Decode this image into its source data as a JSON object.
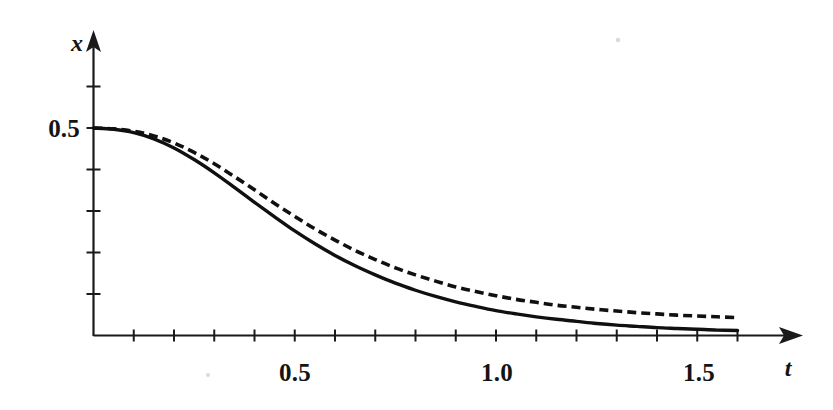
{
  "figure": {
    "background_color": "#ffffff",
    "ink_color": "#101010",
    "width": 833,
    "height": 410
  },
  "axes": {
    "x_axis": {
      "name": "t",
      "labels": [
        "0.5",
        "1.0",
        "1.5"
      ],
      "label_values": [
        0.5,
        1.0,
        1.5
      ],
      "tick_values": [
        0.1,
        0.2,
        0.3,
        0.4,
        0.5,
        0.6,
        0.7,
        0.8,
        0.9,
        1.0,
        1.1,
        1.2,
        1.3,
        1.4,
        1.5,
        1.6
      ],
      "range": [
        0,
        1.76
      ],
      "arrow": "right-arrow"
    },
    "y_axis": {
      "name": "x",
      "labels": [
        "0.5"
      ],
      "label_values": [
        0.5
      ],
      "tick_values": [
        0.1,
        0.2,
        0.3,
        0.4,
        0.5,
        0.6
      ],
      "range": [
        0,
        0.73
      ],
      "arrow": "up-arrow"
    }
  },
  "chart_data": {
    "type": "line",
    "title": "",
    "xlabel": "t",
    "ylabel": "x",
    "xlim": [
      0,
      1.76
    ],
    "ylim": [
      0,
      0.73
    ],
    "grid": false,
    "legend": "none",
    "xticks": [
      0.1,
      0.2,
      0.3,
      0.4,
      0.5,
      0.6,
      0.7,
      0.8,
      0.9,
      1.0,
      1.1,
      1.2,
      1.3,
      1.4,
      1.5,
      1.6
    ],
    "xticklabels": [
      "",
      "",
      "",
      "",
      "0.5",
      "",
      "",
      "",
      "",
      "1.0",
      "",
      "",
      "",
      "",
      "1.5",
      ""
    ],
    "yticks": [
      0.1,
      0.2,
      0.3,
      0.4,
      0.5,
      0.6
    ],
    "yticklabels": [
      "",
      "",
      "",
      "",
      "0.5",
      ""
    ],
    "series": [
      {
        "name": "solid-curve",
        "style": "solid",
        "x": [
          0.0,
          0.05,
          0.1,
          0.15,
          0.2,
          0.25,
          0.3,
          0.35,
          0.4,
          0.45,
          0.5,
          0.55,
          0.6,
          0.65,
          0.7,
          0.75,
          0.8,
          0.85,
          0.9,
          0.95,
          1.0,
          1.05,
          1.1,
          1.15,
          1.2,
          1.25,
          1.3,
          1.35,
          1.4,
          1.45,
          1.5,
          1.55,
          1.6
        ],
        "y": [
          0.5,
          0.497,
          0.489,
          0.474,
          0.452,
          0.424,
          0.392,
          0.357,
          0.321,
          0.286,
          0.252,
          0.221,
          0.193,
          0.168,
          0.146,
          0.126,
          0.109,
          0.094,
          0.081,
          0.07,
          0.06,
          0.052,
          0.045,
          0.039,
          0.034,
          0.029,
          0.025,
          0.022,
          0.019,
          0.017,
          0.015,
          0.013,
          0.012
        ]
      },
      {
        "name": "dashed-curve",
        "style": "dashed",
        "x": [
          0.0,
          0.05,
          0.1,
          0.15,
          0.2,
          0.25,
          0.3,
          0.35,
          0.4,
          0.45,
          0.5,
          0.55,
          0.6,
          0.65,
          0.7,
          0.75,
          0.8,
          0.85,
          0.9,
          0.95,
          1.0,
          1.05,
          1.1,
          1.15,
          1.2,
          1.25,
          1.3,
          1.35,
          1.4,
          1.45,
          1.5,
          1.55,
          1.6
        ],
        "y": [
          0.5,
          0.498,
          0.492,
          0.481,
          0.464,
          0.441,
          0.414,
          0.383,
          0.351,
          0.318,
          0.287,
          0.257,
          0.23,
          0.205,
          0.183,
          0.163,
          0.146,
          0.131,
          0.117,
          0.106,
          0.096,
          0.087,
          0.08,
          0.073,
          0.068,
          0.063,
          0.059,
          0.055,
          0.052,
          0.049,
          0.047,
          0.045,
          0.043
        ]
      }
    ]
  },
  "artifacts": [
    {
      "name": "scan-speck-upper",
      "x": 618,
      "y": 40,
      "r": 2.2
    },
    {
      "name": "scan-speck-lower",
      "x": 208,
      "y": 375,
      "r": 2.0
    }
  ]
}
